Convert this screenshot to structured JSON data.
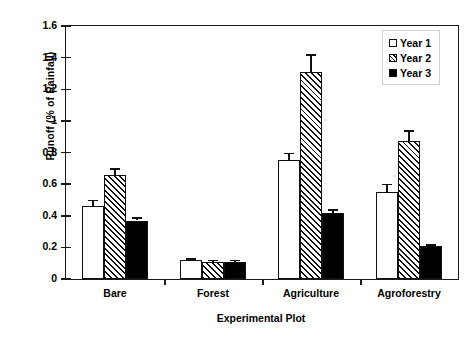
{
  "chart_data": {
    "type": "bar",
    "title": "",
    "subtitle": "",
    "xlabel": "Experimental Plot",
    "ylabel": "Runoff (% of Rainfall)",
    "categories": [
      "Bare",
      "Forest",
      "Agriculture",
      "Agroforestry"
    ],
    "series": [
      {
        "name": "Year 1",
        "fill": "open-white",
        "values": [
          0.46,
          0.12,
          0.75,
          0.55
        ],
        "errors": [
          0.04,
          0.01,
          0.05,
          0.05
        ]
      },
      {
        "name": "Year 2",
        "fill": "diagonal-hatch",
        "values": [
          0.66,
          0.11,
          1.31,
          0.87
        ],
        "errors": [
          0.04,
          0.01,
          0.11,
          0.07
        ]
      },
      {
        "name": "Year 3",
        "fill": "solid-black",
        "values": [
          0.37,
          0.11,
          0.42,
          0.21
        ],
        "errors": [
          0.02,
          0.01,
          0.02,
          0.01
        ]
      }
    ],
    "ylim": [
      0,
      1.6
    ],
    "ytick_step": 0.2,
    "yticks": [
      0,
      0.2,
      0.4,
      0.6,
      0.8,
      1,
      1.2,
      1.4,
      1.6
    ],
    "ytick_labels": [
      "0",
      "0.2",
      "0.4",
      "0.6",
      "0.8",
      "1",
      "1.2",
      "1.4",
      "1.6"
    ],
    "grid": false,
    "legend_position": "top-right",
    "error_bar_style": "capped-vertical",
    "colors": {
      "axis": "#1a1a1a",
      "bar_edge": "#111111",
      "year1": "#ffffff",
      "year2_hatch": "#111111",
      "year3": "#000000",
      "legend_border": "#d2d2d2",
      "background": "#ffffff"
    }
  },
  "legend": {
    "items": [
      {
        "label": "Year 1"
      },
      {
        "label": "Year 2"
      },
      {
        "label": "Year 3"
      }
    ]
  }
}
